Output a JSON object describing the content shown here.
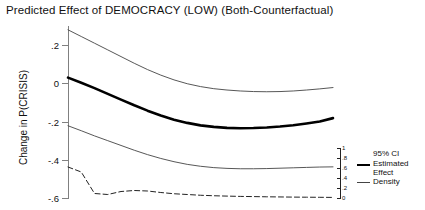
{
  "chart_data": {
    "type": "line",
    "title": "Predicted Effect of DEMOCRACY (LOW) (Both-Counterfactual)",
    "xlabel": "",
    "ylabel": "Change in P(CRISIS)",
    "ylim": [
      -0.6,
      0.3
    ],
    "y2lim": [
      0,
      1
    ],
    "y2label": "",
    "grid": false,
    "legend_position": "right",
    "yticks": [
      0.2,
      0,
      -0.2,
      -0.4,
      -0.6
    ],
    "ytick_labels": [
      ".2",
      "0",
      "-.2",
      "-.4",
      "-.6"
    ],
    "y2ticks": [
      1,
      0.8,
      0.6,
      0.4,
      0.2,
      0
    ],
    "y2tick_labels": [
      "1",
      ".8",
      ".6",
      ".4",
      ".2",
      "0"
    ],
    "x": [
      0,
      0.05,
      0.1,
      0.15,
      0.2,
      0.25,
      0.3,
      0.35,
      0.4,
      0.45,
      0.5,
      0.55,
      0.6,
      0.65,
      0.7,
      0.75,
      0.8,
      0.85,
      0.9,
      0.95,
      1
    ],
    "series": [
      {
        "name": "95% CI upper",
        "style": "thin",
        "axis": "left",
        "values": [
          0.28,
          0.245,
          0.21,
          0.175,
          0.14,
          0.105,
          0.072,
          0.043,
          0.018,
          -0.002,
          -0.017,
          -0.028,
          -0.035,
          -0.04,
          -0.043,
          -0.044,
          -0.043,
          -0.04,
          -0.035,
          -0.029,
          -0.022
        ]
      },
      {
        "name": "Estimated Effect",
        "style": "thick",
        "axis": "left",
        "values": [
          0.03,
          0.003,
          -0.025,
          -0.055,
          -0.085,
          -0.115,
          -0.143,
          -0.168,
          -0.19,
          -0.207,
          -0.22,
          -0.228,
          -0.233,
          -0.235,
          -0.234,
          -0.231,
          -0.226,
          -0.219,
          -0.21,
          -0.2,
          -0.182
        ]
      },
      {
        "name": "95% CI lower",
        "style": "thin",
        "axis": "left",
        "values": [
          -0.222,
          -0.248,
          -0.275,
          -0.3,
          -0.325,
          -0.35,
          -0.373,
          -0.393,
          -0.41,
          -0.424,
          -0.434,
          -0.441,
          -0.445,
          -0.447,
          -0.447,
          -0.446,
          -0.444,
          -0.442,
          -0.44,
          -0.438,
          -0.437
        ]
      },
      {
        "name": "Density",
        "style": "dashed",
        "axis": "right",
        "values": [
          0.62,
          0.52,
          0.09,
          0.07,
          0.13,
          0.15,
          0.14,
          0.11,
          0.085,
          0.07,
          0.055,
          0.045,
          0.038,
          0.032,
          0.028,
          0.024,
          0.021,
          0.018,
          0.016,
          0.014,
          0.012
        ]
      }
    ],
    "legend": [
      {
        "label": "95% CI",
        "style": "none"
      },
      {
        "label": "Estimated\nEffect",
        "style": "thick"
      },
      {
        "label": "Density",
        "style": "thin"
      }
    ],
    "colors": {
      "estimate": "#000000",
      "ci": "#444444",
      "density": "#222222",
      "axis": "#808080",
      "background": "#ffffff"
    }
  }
}
